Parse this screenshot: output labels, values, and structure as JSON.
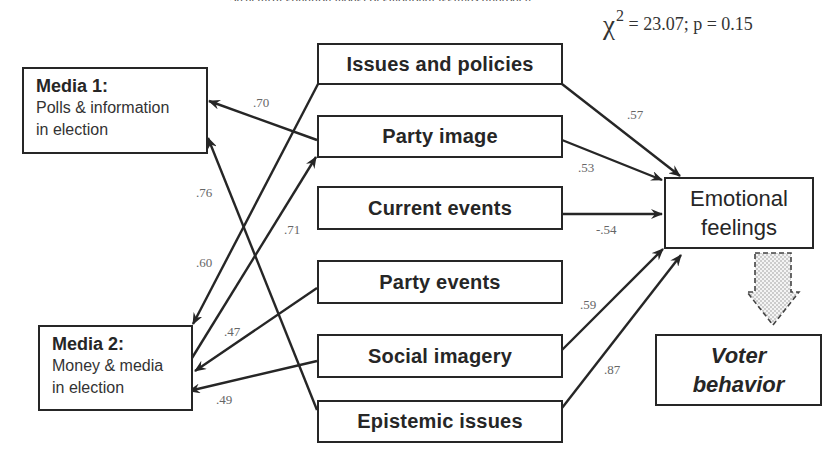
{
  "caption": "Structural equation model of emotional feelings approach",
  "stats": {
    "chi_symbol": "χ",
    "chi_power": "2",
    "text": " = 23.07; p = 0.15"
  },
  "media": [
    {
      "title": "Media 1:",
      "line1": "Polls & information",
      "line2": "in election"
    },
    {
      "title": "Media 2:",
      "line1": "Money & media",
      "line2": "in election"
    }
  ],
  "factors": [
    "Issues and policies",
    "Party image",
    "Current events",
    "Party events",
    "Social imagery",
    "Epistemic issues"
  ],
  "outcomes": {
    "emotional": {
      "line1": "Emotional",
      "line2": "feelings"
    },
    "voter": {
      "line1": "Voter",
      "line2": "behavior"
    }
  },
  "coefficients": {
    "issues_to_emotional": ".57",
    "party_image_to_emotional": ".53",
    "current_events_to_emotional": "-.54",
    "social_imagery_to_emotional": ".59",
    "epistemic_to_emotional": ".87",
    "party_image_to_media1": ".70",
    "epistemic_to_media1": ".76",
    "issues_to_media2": ".60",
    "media2_to_party_image": ".71",
    "party_events_to_media2": ".47",
    "social_imagery_to_media2": ".49"
  },
  "colors": {
    "line": "#262626",
    "coef_text": "#666666",
    "dashed_arrow_fill": "#e8e8e8"
  }
}
